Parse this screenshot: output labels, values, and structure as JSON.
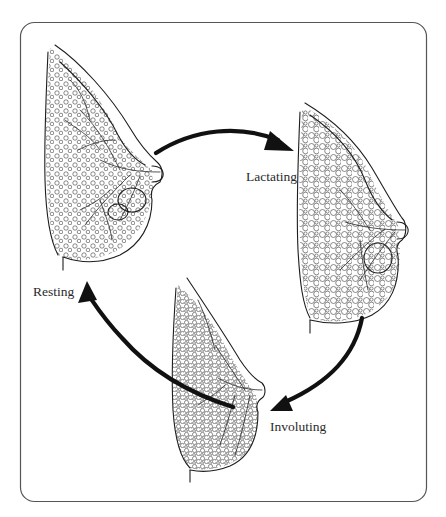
{
  "figure": {
    "type": "lactation cycle diagram",
    "frame": {
      "stroke_color": "#555555",
      "background": "#ffffff"
    },
    "stages": [
      {
        "id": "resting",
        "label": "Resting"
      },
      {
        "id": "lactating",
        "label": "Lactating"
      },
      {
        "id": "involuting",
        "label": "Involuting"
      }
    ],
    "cycle_arrows": [
      {
        "from": "resting",
        "to": "lactating"
      },
      {
        "from": "lactating",
        "to": "involuting"
      },
      {
        "from": "involuting",
        "to": "resting"
      }
    ],
    "colors": {
      "line": "#1e1e1e",
      "arrow": "#111111",
      "text": "#2a2a2a"
    }
  }
}
